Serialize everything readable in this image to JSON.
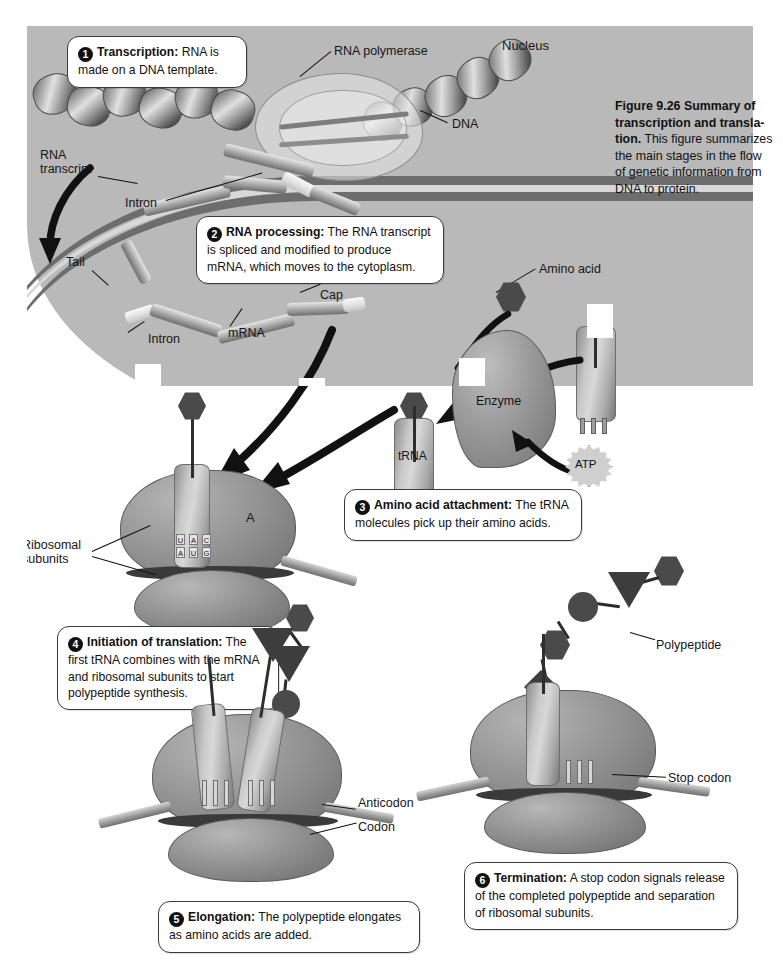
{
  "figure": {
    "number": "Figure 9.26",
    "title": "Summary of transcription and transla-tion.",
    "caption": "This figure summarizes the main stages in the flow of genetic information from DNA to protein."
  },
  "steps": [
    {
      "num": "1",
      "title": "Transcription:",
      "body": "RNA is made on a DNA template."
    },
    {
      "num": "2",
      "title": "RNA processing:",
      "body": "The RNA transcript is spliced and modified to produce mRNA, which moves to the cytoplasm."
    },
    {
      "num": "3",
      "title": "Amino acid attachment:",
      "body": "The tRNA molecules pick up their amino acids."
    },
    {
      "num": "4",
      "title": "Initiation of translation:",
      "body": "The first tRNA combines with the mRNA and ribosomal subunits to start polypeptide synthesis."
    },
    {
      "num": "5",
      "title": "Elongation:",
      "body": "The polypeptide elongates as amino acids are added."
    },
    {
      "num": "6",
      "title": "Termination:",
      "body": "A stop codon signals release of the completed polypeptide and separation of ribosomal subunits."
    }
  ],
  "labels": {
    "nucleus": "Nucleus",
    "rna_polymerase": "RNA polymerase",
    "dna": "DNA",
    "rna_transcript": "RNA\ntranscript",
    "rna_transcript_line1": "RNA",
    "rna_transcript_line2": "transcript",
    "intron_top": "Intron",
    "intron_bottom": "Intron",
    "tail": "Tail",
    "cap": "Cap",
    "mrna": "mRNA",
    "amino_acid": "Amino acid",
    "enzyme": "Enzyme",
    "atp": "ATP",
    "trna": "tRNA",
    "ribosomal_subunits_line1": "Ribosomal",
    "ribosomal_subunits_line2": "subunits",
    "a_site": "A",
    "polypeptide": "Polypeptide",
    "anticodon": "Anticodon",
    "codon": "Codon",
    "stop_codon": "Stop codon"
  },
  "codons": {
    "anticodon_letters": [
      "U",
      "A",
      "C"
    ],
    "codon_letters": [
      "A",
      "U",
      "G"
    ]
  },
  "colors": {
    "nucleus_fill": "#b9b9b9",
    "envelope": "#6d6d6d",
    "callout_border": "#3a3a3a",
    "ink": "#111111",
    "molecule_dark": "#4a4a4a",
    "ribosome_mid": "#969696"
  }
}
